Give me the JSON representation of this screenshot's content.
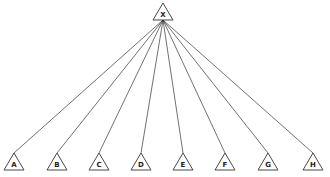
{
  "diagram": {
    "type": "tree",
    "root": {
      "label": "X",
      "apex": [
        163,
        3
      ]
    },
    "leaves": [
      {
        "label": "A",
        "apex": [
          14,
          153
        ]
      },
      {
        "label": "B",
        "apex": [
          57,
          153
        ]
      },
      {
        "label": "C",
        "apex": [
          99,
          153
        ]
      },
      {
        "label": "D",
        "apex": [
          141,
          153
        ]
      },
      {
        "label": "E",
        "apex": [
          183,
          153
        ]
      },
      {
        "label": "F",
        "apex": [
          225,
          153
        ]
      },
      {
        "label": "G",
        "apex": [
          268,
          153
        ]
      },
      {
        "label": "H",
        "apex": [
          313,
          153
        ]
      }
    ],
    "colors": {
      "stroke": "#333333",
      "background": "#ffffff"
    }
  }
}
